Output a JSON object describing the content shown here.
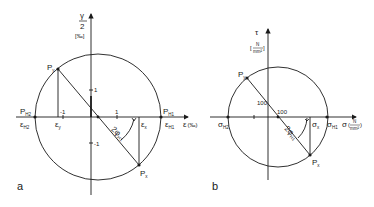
{
  "colors": {
    "ink": "#1a1a1a",
    "background": "#ffffff"
  },
  "diagram_a": {
    "panel_label": "a",
    "y_axis_label_num": "γ",
    "y_axis_label_den": "2",
    "y_axis_unit": "[‰]",
    "x_axis_label": "ε",
    "x_axis_unit": "(‰)",
    "tick_pos_y": "1",
    "tick_neg_y": "-1",
    "tick_pos_x": "1",
    "tick_neg_x": "-1",
    "point_py": "P",
    "point_py_sub": "y",
    "point_px": "P",
    "point_px_sub": "x",
    "point_ph1": "P",
    "point_ph1_sub": "H1",
    "point_ph2": "P",
    "point_ph2_sub": "H2",
    "eps_h1": "ε",
    "eps_h1_sub": "H1",
    "eps_h2": "ε",
    "eps_h2_sub": "H2",
    "eps_x": "ε",
    "eps_x_sub": "x",
    "eps_y": "ε",
    "eps_y_sub": "y",
    "angle_label": "2φ",
    "angle_sub": "H1"
  },
  "diagram_b": {
    "panel_label": "b",
    "y_axis_label": "τ",
    "y_axis_unit_num": "N",
    "y_axis_unit_den": "mm²",
    "x_axis_label": "σ",
    "x_axis_unit_num": "N",
    "x_axis_unit_den": "mm²",
    "tick_y": "100",
    "tick_x": "100",
    "point_py": "P",
    "point_py_sub": "y",
    "point_px": "P",
    "point_px_sub": "x",
    "sigma_h1": "σ",
    "sigma_h1_sub": "H1",
    "sigma_h2": "σ",
    "sigma_h2_sub": "H2",
    "sigma_x": "σ",
    "sigma_x_sub": "x",
    "angle_label": "2φ",
    "angle_sub": "H1"
  }
}
